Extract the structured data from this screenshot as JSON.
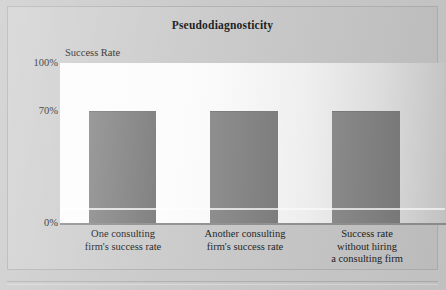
{
  "figure": {
    "title": "Pseudodiagnosticity",
    "y_axis_title": "Success Rate"
  },
  "colors": {
    "bar_fill": "#818181",
    "page_background": "#c8c8c8",
    "plot_background": "#fdfdfd",
    "frame_border": "#b0b0b0",
    "axis_line": "#8f8f8f",
    "text": "#1a1a1a"
  },
  "chart_data": {
    "type": "bar",
    "title": "Pseudodiagnosticity",
    "xlabel": "",
    "ylabel": "Success Rate",
    "ylim": [
      0,
      100
    ],
    "yticks": [
      0,
      70,
      100
    ],
    "ytick_labels": [
      "0%",
      "70%",
      "100%"
    ],
    "grid": false,
    "legend": false,
    "categories": [
      "One consulting firm's success rate",
      "Another consulting firm's success rate",
      "Success rate without hiring a consulting firm"
    ],
    "category_lines": [
      [
        "One consulting",
        "firm's success rate"
      ],
      [
        "Another consulting",
        "firm's success rate"
      ],
      [
        "Success rate",
        "without hiring",
        "a consulting firm"
      ]
    ],
    "values": [
      70,
      70,
      70
    ],
    "value_unit": "%"
  }
}
